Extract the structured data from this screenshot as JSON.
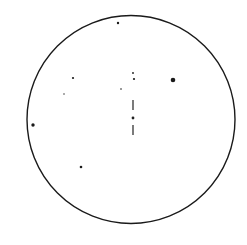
{
  "diagram": {
    "type": "star-finder-chart",
    "field": {
      "cx": 131,
      "cy": 119.5,
      "r": 104,
      "stroke": "#1a1a1a",
      "stroke_width": 1.4
    },
    "target_marker": {
      "x": 133,
      "center_dot": {
        "y": 118,
        "r": 1.4
      },
      "upper_tick": {
        "y1": 100,
        "y2": 110
      },
      "lower_tick": {
        "y1": 125,
        "y2": 135
      },
      "color": "#222222"
    },
    "stars": [
      {
        "x": 118,
        "y": 23,
        "r": 1.2
      },
      {
        "x": 133,
        "y": 73,
        "r": 0.9
      },
      {
        "x": 134,
        "y": 79,
        "r": 1.1
      },
      {
        "x": 173,
        "y": 80,
        "r": 2.3
      },
      {
        "x": 73,
        "y": 78,
        "r": 1.1
      },
      {
        "x": 121,
        "y": 89,
        "r": 0.8
      },
      {
        "x": 64,
        "y": 94,
        "r": 0.7
      },
      {
        "x": 33,
        "y": 125,
        "r": 1.7
      },
      {
        "x": 81,
        "y": 167,
        "r": 1.3
      }
    ],
    "star_color": "#1a1a1a"
  }
}
